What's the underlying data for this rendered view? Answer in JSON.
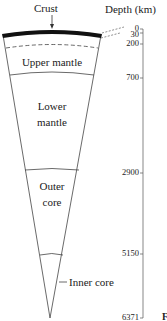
{
  "diagram": {
    "title_left": "Crust",
    "title_right": "Depth (km)",
    "layers": [
      {
        "name": "Crust",
        "label": ""
      },
      {
        "name": "Upper mantle",
        "label": "Upper mantle"
      },
      {
        "name": "Lower mantle",
        "label_line1": "Lower",
        "label_line2": "mantle"
      },
      {
        "name": "Outer core",
        "label_line1": "Outer",
        "label_line2": "core"
      },
      {
        "name": "Inner core",
        "label": "Inner core"
      }
    ],
    "depth_ticks": [
      "0",
      "30",
      "200",
      "700",
      "2900",
      "5150",
      "6371"
    ],
    "cropped_text": "F",
    "colors": {
      "line": "#333333",
      "crust": "#111111",
      "background": "#ffffff"
    }
  }
}
